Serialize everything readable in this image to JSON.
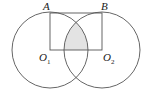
{
  "diagram": {
    "type": "geometry",
    "points": {
      "A": {
        "label": "A",
        "x": 50,
        "y": 13
      },
      "B": {
        "label": "B",
        "x": 102,
        "y": 13
      },
      "O1": {
        "label": "O",
        "sub": "1",
        "x": 50,
        "y": 50
      },
      "O2": {
        "label": "O",
        "sub": "2",
        "x": 102,
        "y": 50
      }
    },
    "circles": [
      {
        "center": "O1",
        "radius": 38
      },
      {
        "center": "O2",
        "radius": 38
      }
    ],
    "colors": {
      "stroke": "#555555",
      "shade": "#e3e3e3"
    }
  }
}
